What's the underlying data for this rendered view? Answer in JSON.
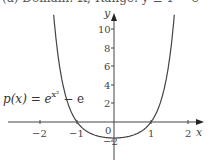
{
  "caption": "(a) Domain: ℝ; Range: y ≥ 1 − e",
  "function_label": {
    "prefix": "p(x) = e",
    "exponent": "x²",
    "suffix": " − e"
  },
  "axes": {
    "x_name": "x",
    "y_name": "y"
  },
  "chart_data": {
    "type": "line",
    "title": "",
    "function": "p(x) = e^(x^2) - e",
    "xlabel": "x",
    "ylabel": "y",
    "xlim": [
      -2.5,
      2.5
    ],
    "ylim": [
      -3.5,
      11
    ],
    "x_ticks": [
      -2,
      -1,
      1,
      2
    ],
    "x_tick_labels": [
      "−2",
      "−1",
      "1",
      "2"
    ],
    "y_ticks": [
      2,
      4,
      6,
      8,
      10
    ],
    "y_tick_labels": [
      "2",
      "4",
      "6",
      "8",
      "10"
    ],
    "origin_label": "0",
    "annotations": [
      {
        "text": "−2",
        "note": "y-intercept marker near minimum (1 − e ≈ −1.72)"
      }
    ],
    "grid": false,
    "legend": null,
    "series": [
      {
        "name": "p(x) = e^(x^2) − e",
        "x": [
          -1.62,
          -1.5,
          -1.25,
          -1.0,
          -0.75,
          -0.5,
          -0.25,
          0,
          0.25,
          0.5,
          0.75,
          1.0,
          1.25,
          1.5,
          1.62
        ],
        "y": [
          11.0,
          6.77,
          4.05,
          0.0,
          -0.97,
          -1.43,
          -1.65,
          -1.72,
          -1.65,
          -1.43,
          -0.97,
          0.0,
          4.05,
          6.77,
          11.0
        ]
      }
    ],
    "roots": [
      -1,
      1
    ],
    "minimum": {
      "x": 0,
      "y": -1.72
    }
  }
}
